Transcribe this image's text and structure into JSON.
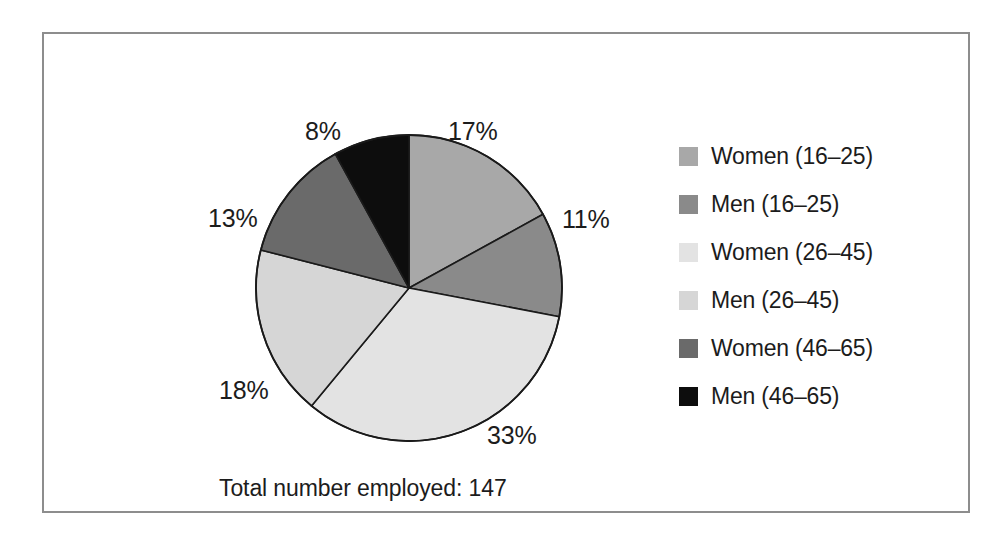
{
  "caption": "Total number employed: 147",
  "chart_data": {
    "type": "pie",
    "title": "",
    "subtitle": "",
    "xlabel": "",
    "ylabel": "",
    "total_label": "Total number employed: 147",
    "total_value": 147,
    "unit": "%",
    "legend_position": "right",
    "grid": false,
    "start_angle_deg": 0,
    "direction": "clockwise",
    "categories": [
      "Women (16–25)",
      "Men (16–25)",
      "Women (26–45)",
      "Men (26–45)",
      "Women (46–65)",
      "Men (46–65)"
    ],
    "values": [
      17,
      11,
      33,
      18,
      13,
      8
    ],
    "data_labels": [
      "17%",
      "11%",
      "33%",
      "18%",
      "13%",
      "8%"
    ],
    "colors": [
      "#a8a8a8",
      "#8a8a8a",
      "#e3e3e3",
      "#d6d6d6",
      "#6a6a6a",
      "#0d0d0d"
    ],
    "slices": [
      {
        "label": "Women (16–25)",
        "value": 17,
        "data_label": "17%",
        "color": "#a8a8a8"
      },
      {
        "label": "Men (16–25)",
        "value": 11,
        "data_label": "11%",
        "color": "#8a8a8a"
      },
      {
        "label": "Women (26–45)",
        "value": 33,
        "data_label": "33%",
        "color": "#e3e3e3"
      },
      {
        "label": "Men (26–45)",
        "value": 18,
        "data_label": "18%",
        "color": "#d6d6d6"
      },
      {
        "label": "Women (46–65)",
        "value": 13,
        "data_label": "13%",
        "color": "#6a6a6a"
      },
      {
        "label": "Men (46–65)",
        "value": 8,
        "data_label": "8%",
        "color": "#0d0d0d"
      }
    ]
  },
  "colors": {
    "frame_border": "#8d8d8d",
    "background": "#ffffff",
    "text": "#1c1c1c",
    "slice_outline": "#1a1a1a"
  }
}
